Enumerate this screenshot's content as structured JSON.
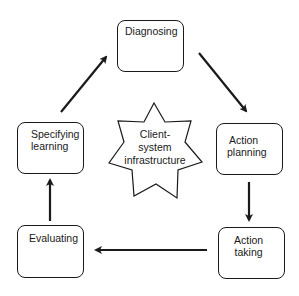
{
  "diagram": {
    "type": "cycle",
    "center": {
      "shape": "7-point-star",
      "lines": [
        "Client-",
        "system",
        "infrastructure"
      ]
    },
    "nodes": [
      {
        "id": "diagnosing",
        "lines": [
          "Diagnosing"
        ]
      },
      {
        "id": "action-planning",
        "lines": [
          "Action",
          "planning"
        ]
      },
      {
        "id": "action-taking",
        "lines": [
          "Action",
          "taking"
        ]
      },
      {
        "id": "evaluating",
        "lines": [
          "Evaluating"
        ]
      },
      {
        "id": "specifying-learning",
        "lines": [
          "Specifying",
          "learning"
        ]
      }
    ],
    "edges": [
      {
        "from": "diagnosing",
        "to": "action-planning"
      },
      {
        "from": "action-planning",
        "to": "action-taking"
      },
      {
        "from": "action-taking",
        "to": "evaluating"
      },
      {
        "from": "evaluating",
        "to": "specifying-learning"
      },
      {
        "from": "specifying-learning",
        "to": "diagnosing"
      }
    ],
    "colors": {
      "stroke": "#1a1a1a",
      "background": "#ffffff"
    }
  }
}
